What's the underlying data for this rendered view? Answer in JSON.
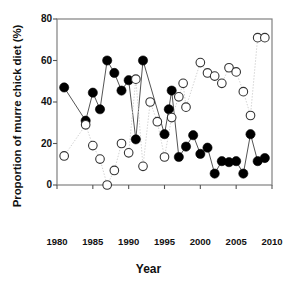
{
  "chart_data": {
    "type": "scatter",
    "title": "",
    "xlabel": "Year",
    "ylabel": "Proportion of murre chick diet (%)",
    "xlim": [
      1980,
      2010
    ],
    "ylim": [
      0,
      80
    ],
    "xticks": [
      1980,
      1985,
      1990,
      1995,
      2000,
      2005,
      2010
    ],
    "yticks": [
      0,
      20,
      40,
      60,
      80
    ],
    "grid": false,
    "legend": "none",
    "series": [
      {
        "name": "filled-circles",
        "marker": "filled-circle",
        "color": "#000000",
        "line_style": "solid",
        "points": [
          {
            "x": 1981,
            "y": 47
          },
          {
            "x": 1984,
            "y": 31
          },
          {
            "x": 1985,
            "y": 44.5
          },
          {
            "x": 1986,
            "y": 36.5
          },
          {
            "x": 1987,
            "y": 60
          },
          {
            "x": 1988,
            "y": 54
          },
          {
            "x": 1989,
            "y": 45.5
          },
          {
            "x": 1990,
            "y": 50.5
          },
          {
            "x": 1991,
            "y": 22
          },
          {
            "x": 1992,
            "y": 60
          },
          {
            "x": 1995,
            "y": 24.5
          },
          {
            "x": 1995.6,
            "y": 36.5
          },
          {
            "x": 1996,
            "y": 45.5
          },
          {
            "x": 1997,
            "y": 13.5
          },
          {
            "x": 1998,
            "y": 18.5
          },
          {
            "x": 1999,
            "y": 24
          },
          {
            "x": 2000,
            "y": 15
          },
          {
            "x": 2001,
            "y": 18
          },
          {
            "x": 2002,
            "y": 5.5
          },
          {
            "x": 2003,
            "y": 11.5
          },
          {
            "x": 2004,
            "y": 11
          },
          {
            "x": 2005,
            "y": 11.5
          },
          {
            "x": 2006,
            "y": 5.5
          },
          {
            "x": 2007,
            "y": 24.5
          },
          {
            "x": 2008,
            "y": 11.5
          },
          {
            "x": 2009,
            "y": 13
          }
        ]
      },
      {
        "name": "open-circles",
        "marker": "open-circle",
        "color": "#ffffff",
        "edge_color": "#222222",
        "line_style": "dotted",
        "points": [
          {
            "x": 1981,
            "y": 14
          },
          {
            "x": 1984,
            "y": 29
          },
          {
            "x": 1985,
            "y": 19
          },
          {
            "x": 1986,
            "y": 12.5
          },
          {
            "x": 1987,
            "y": 0
          },
          {
            "x": 1988,
            "y": 7
          },
          {
            "x": 1989,
            "y": 20
          },
          {
            "x": 1990,
            "y": 15.5
          },
          {
            "x": 1991,
            "y": 51
          },
          {
            "x": 1992,
            "y": 9
          },
          {
            "x": 1993,
            "y": 40
          },
          {
            "x": 1994,
            "y": 30.5
          },
          {
            "x": 1995,
            "y": 13.5
          },
          {
            "x": 1996,
            "y": 32.5
          },
          {
            "x": 1997,
            "y": 42.5
          },
          {
            "x": 1997.6,
            "y": 49
          },
          {
            "x": 1998,
            "y": 37.5
          },
          {
            "x": 2000,
            "y": 59
          },
          {
            "x": 2001,
            "y": 54
          },
          {
            "x": 2002,
            "y": 52.5
          },
          {
            "x": 2003,
            "y": 49
          },
          {
            "x": 2004,
            "y": 56.5
          },
          {
            "x": 2005,
            "y": 54.5
          },
          {
            "x": 2006,
            "y": 45
          },
          {
            "x": 2007,
            "y": 33.5
          },
          {
            "x": 2008,
            "y": 71
          },
          {
            "x": 2009,
            "y": 71
          }
        ]
      }
    ]
  },
  "axes": {
    "x_tick_labels": [
      "1980",
      "1985",
      "1990",
      "1995",
      "2000",
      "2005",
      "2010"
    ],
    "y_tick_labels": [
      "0",
      "20",
      "40",
      "60",
      "80"
    ],
    "x_title": "Year",
    "y_title": "Proportion of murre chick diet (%)"
  }
}
